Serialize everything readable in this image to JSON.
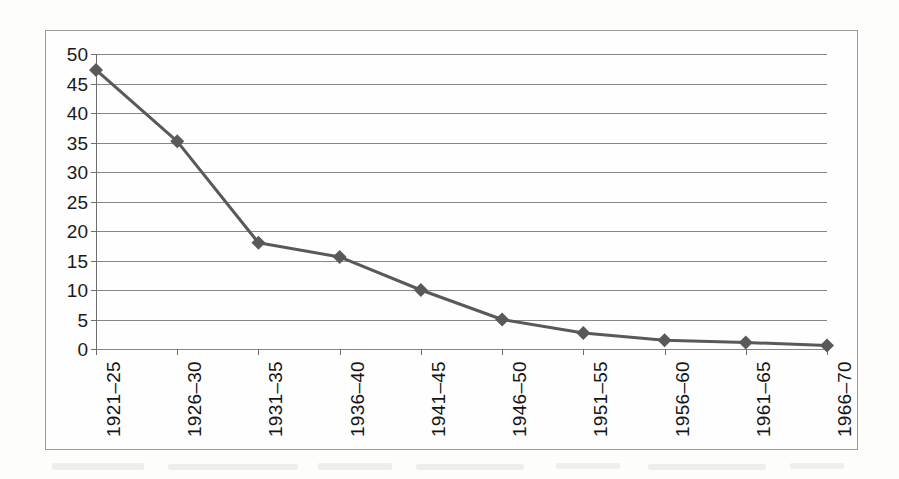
{
  "chart_data": {
    "type": "line",
    "title": "",
    "xlabel": "",
    "ylabel": "",
    "categories": [
      "1921–25",
      "1926–30",
      "1931–35",
      "1936–40",
      "1941–45",
      "1946–50",
      "1951–55",
      "1956–60",
      "1961–65",
      "1966–70"
    ],
    "values": [
      47.3,
      35.2,
      18.0,
      15.6,
      10.0,
      5.0,
      2.7,
      1.5,
      1.1,
      0.6
    ],
    "series": [
      {
        "name": "series-1",
        "values": [
          47.3,
          35.2,
          18.0,
          15.6,
          10.0,
          5.0,
          2.7,
          1.5,
          1.1,
          0.6
        ]
      }
    ],
    "ylim": [
      0,
      50
    ],
    "y_ticks": [
      0,
      5,
      10,
      15,
      20,
      25,
      30,
      35,
      40,
      45,
      50
    ],
    "y_tick_labels": [
      "0",
      "5",
      "10",
      "15",
      "20",
      "25",
      "30",
      "35",
      "40",
      "45",
      "50"
    ],
    "grid": true,
    "grid_axis": "y",
    "legend": false,
    "legend_position": "none",
    "marker": "diamond",
    "series_color": "#595959",
    "gridline_color": "#868686",
    "axis_color": "#6e6e6e",
    "frame_color": "#9a9a9a",
    "background_color": "#fefefe",
    "x_label_rotation": "90",
    "annotations": []
  }
}
